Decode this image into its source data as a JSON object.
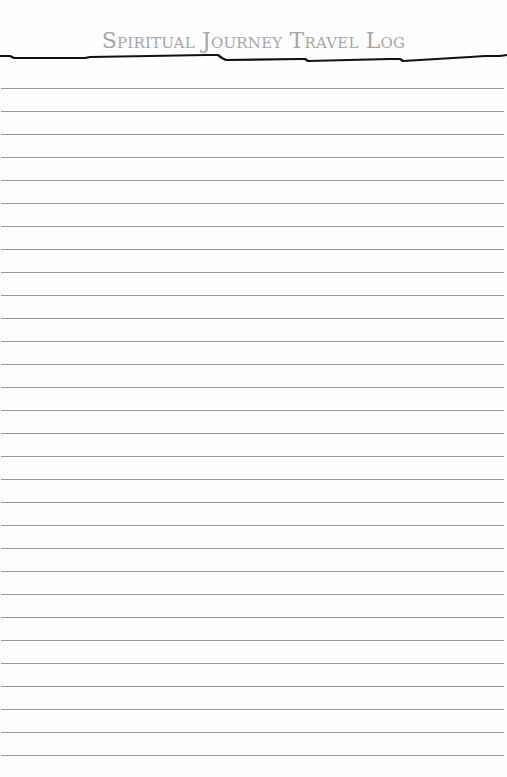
{
  "header": {
    "title": "Spiritual Journey Travel Log"
  },
  "ruled_lines": {
    "count": 30,
    "first_y": 88,
    "spacing": 23,
    "color": "#9a9a9a"
  },
  "colors": {
    "title": "#a6a6a6",
    "title_rule": "#111111",
    "paper": "#fefefe"
  }
}
